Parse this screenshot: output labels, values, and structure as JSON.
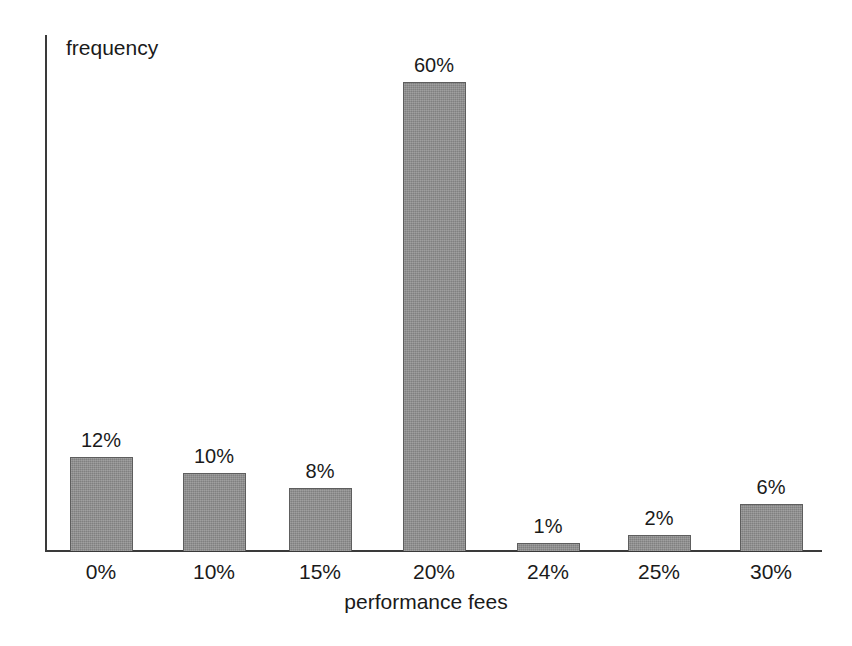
{
  "chart_data": {
    "type": "bar",
    "title": "",
    "subtitle": "",
    "xlabel": "performance fees",
    "ylabel": "frequency",
    "categories": [
      "0%",
      "10%",
      "15%",
      "20%",
      "24%",
      "25%",
      "30%"
    ],
    "values": [
      12,
      10,
      8,
      60,
      1,
      2,
      6
    ],
    "value_labels": [
      "12%",
      "10%",
      "8%",
      "60%",
      "1%",
      "2%",
      "6%"
    ],
    "ylim": [
      0,
      66
    ],
    "grid": false,
    "legend": null,
    "legend_position": "none",
    "series": [
      {
        "name": "frequency",
        "values": [
          12,
          10,
          8,
          60,
          1,
          2,
          6
        ]
      }
    ],
    "annotations": []
  },
  "axes": {
    "y_title": "frequency",
    "x_title": "performance fees"
  },
  "style": {
    "bar_fill": "#8b8b8b",
    "bar_border": "#5e5e5e",
    "axis_color": "#3a3a3a",
    "text_color": "#1a1a1a",
    "background": "#ffffff"
  }
}
